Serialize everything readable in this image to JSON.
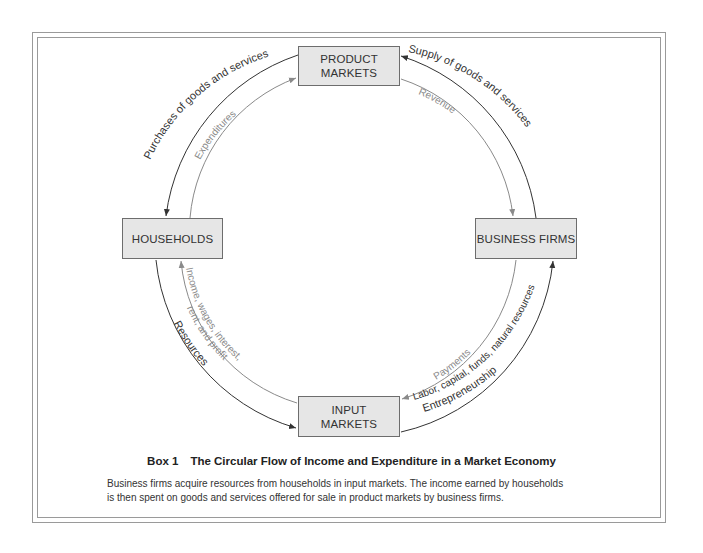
{
  "diagram": {
    "nodes": {
      "product_markets": {
        "line1": "PRODUCT",
        "line2": "MARKETS"
      },
      "households": {
        "label": "HOUSEHOLDS"
      },
      "business_firms": {
        "label": "BUSINESS FIRMS"
      },
      "input_markets": {
        "line1": "INPUT",
        "line2": "MARKETS"
      }
    },
    "flows": {
      "purchases": "Purchases of goods and services",
      "expenditures": "Expenditures",
      "supply": "Supply of goods and services",
      "revenue": "Revenue",
      "resources": "Resources",
      "income_line1": "Income, wages, interest,",
      "income_line2": "rent, and profit",
      "payments": "Payments",
      "labor": "Labor, capital, funds, natural resources",
      "entrepreneurship": "Entrepreneurship"
    },
    "colors": {
      "real_flow": "#333333",
      "money_flow": "#8a8a8a",
      "node_fill": "#e6e6e6"
    }
  },
  "caption": {
    "box_number": "Box 1",
    "title": "The Circular Flow of Income and Expenditure in a Market Economy",
    "body_line1": "Business firms acquire resources from households in input markets. The income earned by households",
    "body_line2": "is then spent on goods and services offered for sale in product markets by business firms."
  }
}
